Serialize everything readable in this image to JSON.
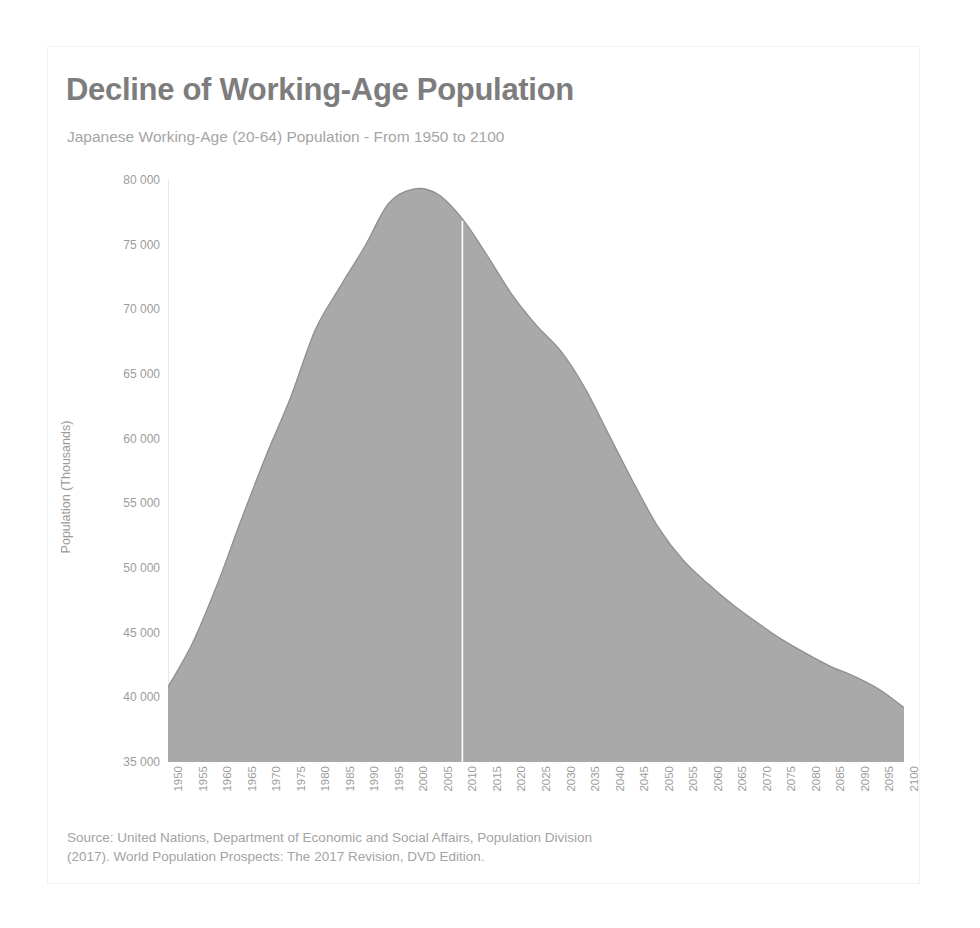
{
  "header": {
    "title": "Decline of Working-Age Population",
    "subtitle": "Japanese Working-Age (20-64) Population - From 1950 to 2100",
    "title_color": "#7d7d7d",
    "subtitle_color": "#a5a5a5"
  },
  "source": {
    "line1": "Source: United Nations, Department of Economic and Social Affairs, Population Division",
    "line2": "(2017). World Population Prospects: The 2017 Revision, DVD Edition."
  },
  "colors": {
    "area_fill": "#a9a9a9",
    "area_stroke": "#8f8f8f",
    "axis_line": "#e8e8e8",
    "divider_line": "#ffffff",
    "tick_text": "#9c9c9c"
  },
  "chart_data": {
    "type": "area",
    "title": "Decline of Working-Age Population",
    "subtitle": "Japanese Working-Age (20-64) Population - From 1950 to 2100",
    "xlabel": "",
    "ylabel": "Population (Thousands)",
    "xlim": [
      1950,
      2100
    ],
    "ylim": [
      35000,
      80000
    ],
    "grid": false,
    "legend": "none",
    "ytick_labels": [
      "80 000",
      "75 000",
      "70 000",
      "65 000",
      "60 000",
      "55 000",
      "50 000",
      "45 000",
      "40 000",
      "35 000"
    ],
    "ytick_values": [
      80000,
      75000,
      70000,
      65000,
      60000,
      55000,
      50000,
      45000,
      40000,
      35000
    ],
    "xtick_labels": [
      "1950",
      "1955",
      "1960",
      "1965",
      "1970",
      "1975",
      "1980",
      "1985",
      "1990",
      "1995",
      "2000",
      "2005",
      "2010",
      "2015",
      "2020",
      "2025",
      "2030",
      "2035",
      "2040",
      "2045",
      "2050",
      "2055",
      "2060",
      "2065",
      "2070",
      "2075",
      "2080",
      "2085",
      "2090",
      "2095",
      "2100"
    ],
    "annotation": {
      "divider_year": 2010,
      "divider_note": "white vertical line separating estimates from projections"
    },
    "x": [
      1950,
      1955,
      1960,
      1965,
      1970,
      1975,
      1980,
      1985,
      1990,
      1995,
      2000,
      2005,
      2010,
      2015,
      2020,
      2025,
      2030,
      2035,
      2040,
      2045,
      2050,
      2055,
      2060,
      2065,
      2070,
      2075,
      2080,
      2085,
      2090,
      2095,
      2100
    ],
    "values": [
      40800,
      44200,
      48700,
      53800,
      58700,
      63200,
      68400,
      71700,
      74800,
      78200,
      79300,
      78900,
      77000,
      74200,
      71200,
      68800,
      66800,
      63900,
      60200,
      56500,
      53100,
      50600,
      48800,
      47200,
      45800,
      44500,
      43400,
      42400,
      41600,
      40600,
      39200
    ]
  }
}
